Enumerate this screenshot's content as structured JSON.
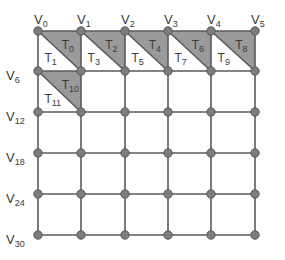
{
  "diagram": {
    "type": "triangulated-grid-mesh",
    "grid": {
      "columns": 6,
      "rows": 6
    },
    "colors": {
      "line": "#5a5a5a",
      "vertex_fill": "#7d7d7d",
      "vertex_stroke": "#5a5a5a",
      "shaded_triangle": "#9a9a9a",
      "background": "#ffffff",
      "text": "#3a3a3a"
    },
    "vertex_labels": [
      {
        "id": 0,
        "base": "V",
        "sub": "0"
      },
      {
        "id": 1,
        "base": "V",
        "sub": "1"
      },
      {
        "id": 2,
        "base": "V",
        "sub": "2"
      },
      {
        "id": 3,
        "base": "V",
        "sub": "3"
      },
      {
        "id": 4,
        "base": "V",
        "sub": "4"
      },
      {
        "id": 5,
        "base": "V",
        "sub": "5"
      },
      {
        "id": 6,
        "base": "V",
        "sub": "6"
      },
      {
        "id": 12,
        "base": "V",
        "sub": "12"
      },
      {
        "id": 18,
        "base": "V",
        "sub": "18"
      },
      {
        "id": 24,
        "base": "V",
        "sub": "24"
      },
      {
        "id": 30,
        "base": "V",
        "sub": "30"
      }
    ],
    "triangles": [
      {
        "id": 0,
        "base": "T",
        "sub": "0",
        "shaded": true
      },
      {
        "id": 1,
        "base": "T",
        "sub": "1",
        "shaded": false
      },
      {
        "id": 2,
        "base": "T",
        "sub": "2",
        "shaded": true
      },
      {
        "id": 3,
        "base": "T",
        "sub": "3",
        "shaded": false
      },
      {
        "id": 4,
        "base": "T",
        "sub": "4",
        "shaded": true
      },
      {
        "id": 5,
        "base": "T",
        "sub": "5",
        "shaded": false
      },
      {
        "id": 6,
        "base": "T",
        "sub": "6",
        "shaded": true
      },
      {
        "id": 7,
        "base": "T",
        "sub": "7",
        "shaded": false
      },
      {
        "id": 8,
        "base": "T",
        "sub": "8",
        "shaded": true
      },
      {
        "id": 9,
        "base": "T",
        "sub": "9",
        "shaded": false
      },
      {
        "id": 10,
        "base": "T",
        "sub": "10",
        "shaded": true
      },
      {
        "id": 11,
        "base": "T",
        "sub": "11",
        "shaded": false
      }
    ]
  }
}
